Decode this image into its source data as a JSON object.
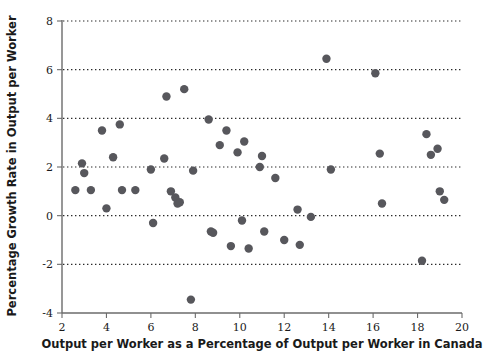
{
  "chart_data": {
    "type": "scatter",
    "title": "",
    "subtitle": "",
    "xlabel": "Output per Worker as a Percentage of Output per Worker in Canada",
    "ylabel": "Percentage Growth Rate in Output per Worker",
    "xlim": [
      2,
      20
    ],
    "ylim": [
      -4,
      8
    ],
    "xticks": [
      2,
      4,
      6,
      8,
      10,
      12,
      14,
      16,
      18,
      20
    ],
    "yticks": [
      -4,
      -2,
      0,
      2,
      4,
      6,
      8
    ],
    "xtick_labels": [
      "2",
      "4",
      "6",
      "8",
      "10",
      "12",
      "14",
      "16",
      "18",
      "20"
    ],
    "ytick_labels": [
      "-4",
      "-2",
      "0",
      "2",
      "4",
      "6",
      "8"
    ],
    "grid": "horizontal-dotted",
    "gridlines_y": [
      -2,
      0,
      2,
      4,
      6,
      8
    ],
    "legend": "none",
    "marker": "filled-circle",
    "marker_color": "#57575c",
    "marker_size": 4.2,
    "axis_color": "#6b6b6b",
    "background": "#ffffff",
    "points": [
      [
        2.6,
        1.05
      ],
      [
        2.9,
        2.15
      ],
      [
        3.0,
        1.75
      ],
      [
        3.3,
        1.05
      ],
      [
        3.8,
        3.5
      ],
      [
        4.0,
        0.3
      ],
      [
        4.3,
        2.4
      ],
      [
        4.6,
        3.75
      ],
      [
        4.7,
        1.05
      ],
      [
        5.3,
        1.05
      ],
      [
        6.0,
        1.9
      ],
      [
        6.1,
        -0.3
      ],
      [
        6.6,
        2.35
      ],
      [
        6.7,
        4.9
      ],
      [
        6.9,
        1.0
      ],
      [
        7.1,
        0.75
      ],
      [
        7.2,
        0.5
      ],
      [
        7.3,
        0.55
      ],
      [
        7.5,
        5.2
      ],
      [
        7.8,
        -3.45
      ],
      [
        7.9,
        1.85
      ],
      [
        8.6,
        3.95
      ],
      [
        8.7,
        -0.65
      ],
      [
        8.8,
        -0.7
      ],
      [
        9.1,
        2.9
      ],
      [
        9.4,
        3.5
      ],
      [
        9.6,
        -1.25
      ],
      [
        9.9,
        2.6
      ],
      [
        10.1,
        -0.2
      ],
      [
        10.2,
        3.05
      ],
      [
        10.4,
        -1.35
      ],
      [
        10.9,
        2.0
      ],
      [
        11.0,
        2.45
      ],
      [
        11.1,
        -0.65
      ],
      [
        11.6,
        1.55
      ],
      [
        12.0,
        -1.0
      ],
      [
        12.6,
        0.25
      ],
      [
        12.7,
        -1.2
      ],
      [
        13.2,
        -0.05
      ],
      [
        13.9,
        6.45
      ],
      [
        14.1,
        1.9
      ],
      [
        16.1,
        5.85
      ],
      [
        16.3,
        2.55
      ],
      [
        16.4,
        0.5
      ],
      [
        18.2,
        -1.85
      ],
      [
        18.4,
        3.35
      ],
      [
        18.6,
        2.5
      ],
      [
        18.9,
        2.75
      ],
      [
        19.0,
        1.0
      ],
      [
        19.2,
        0.65
      ]
    ]
  }
}
